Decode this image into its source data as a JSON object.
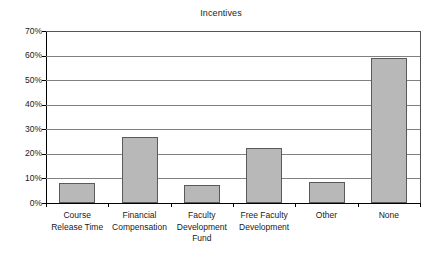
{
  "chart_data": {
    "type": "bar",
    "title": "Incentives",
    "xlabel": "",
    "ylabel": "",
    "categories": [
      "Course Release Time",
      "Financial Compensation",
      "Faculty Development Fund",
      "Free Faculty Development",
      "Other",
      "None"
    ],
    "category_lines": [
      [
        "Course",
        "Release Time"
      ],
      [
        "Financial",
        "Compensation"
      ],
      [
        "Faculty",
        "Development",
        "Fund"
      ],
      [
        "Free Faculty",
        "Development"
      ],
      [
        "Other"
      ],
      [
        "None"
      ]
    ],
    "values": [
      8,
      27,
      7.5,
      22.5,
      8.5,
      59
    ],
    "value_labels": [
      "8%",
      "27%",
      "7.5%",
      "22.5%",
      "8.5%",
      "59%"
    ],
    "ylim": [
      0,
      70
    ],
    "ytick_values": [
      0,
      10,
      20,
      30,
      40,
      50,
      60,
      70
    ],
    "ytick_labels": [
      "0%",
      "10%",
      "20%",
      "30%",
      "40%",
      "50%",
      "60%",
      "70%"
    ],
    "grid": true,
    "grid_axis": "y",
    "legend": false,
    "legend_position": "none",
    "bar_fill_color": "#b8b8b8",
    "bar_border_color": "#5a5a5a",
    "gridline_color": "#808080",
    "axis_color": "#000000",
    "background_color": "#ffffff"
  }
}
